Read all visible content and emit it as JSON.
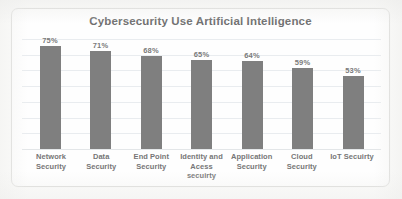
{
  "chart_data": {
    "type": "bar",
    "title": "Cybersecurity Use Artificial Intelligence",
    "xlabel": "",
    "ylabel": "",
    "ylim": [
      0,
      80
    ],
    "grid": true,
    "legend": "none",
    "categories": [
      "Network Security",
      "Data Security",
      "End Point Security",
      "Identity and Acess secuirty",
      "Application Security",
      "Cloud Security",
      "IoT Secuirty"
    ],
    "category_lines": [
      [
        "Network",
        "Security"
      ],
      [
        "Data",
        "Security"
      ],
      [
        "End Point",
        "Security"
      ],
      [
        "Identity and",
        "Acess",
        "secuirty"
      ],
      [
        "Application",
        "Security"
      ],
      [
        "Cloud",
        "Security"
      ],
      [
        "IoT Secuirty"
      ]
    ],
    "values": [
      75,
      71,
      68,
      65,
      64,
      59,
      53
    ],
    "value_labels": [
      "75%",
      "71%",
      "68%",
      "65%",
      "64%",
      "59%",
      "53%"
    ],
    "gridline_count": 8,
    "colors": {
      "bar": "#7f7f7f",
      "title": "#6e6e6e",
      "label": "#767676",
      "gridline": "#e9ecef",
      "frame": "#dcdcda",
      "background": "#fefefe"
    }
  }
}
